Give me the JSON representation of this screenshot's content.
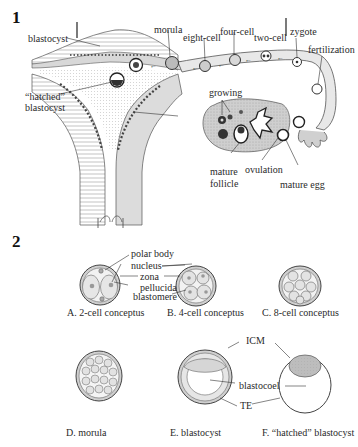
{
  "panel1": {
    "number": "1",
    "labels": {
      "blastocyst": "blastocyst",
      "morula": "morula",
      "eight_cell": "eight-cell",
      "four_cell": "four-cell",
      "two_cell": "two-cell",
      "zygote": "zygote",
      "fertilization": "fertilization",
      "hatched_line1": "“hatched”",
      "hatched_line2": "blastocyst",
      "growing": "growing",
      "mature_follicle_line1": "mature",
      "mature_follicle_line2": "follicle",
      "ovulation": "ovulation",
      "mature_egg": "mature egg"
    }
  },
  "panel2": {
    "number": "2",
    "labels": {
      "polar_body": "polar body",
      "nucleus": "nucleus",
      "zona_line1": "zona",
      "zona_line2": "pellucida",
      "blastomere": "blastomere",
      "icm": "ICM",
      "blastocoel": "blastocoel",
      "te": "TE"
    },
    "captions": {
      "a": "A.  2-cell conceptus",
      "b": "B.  4-cell conceptus",
      "c": "C.  8-cell conceptus",
      "d": "D.  morula",
      "e": "E.  blastocyst",
      "f": "F.  “hatched” blastocyst"
    }
  }
}
